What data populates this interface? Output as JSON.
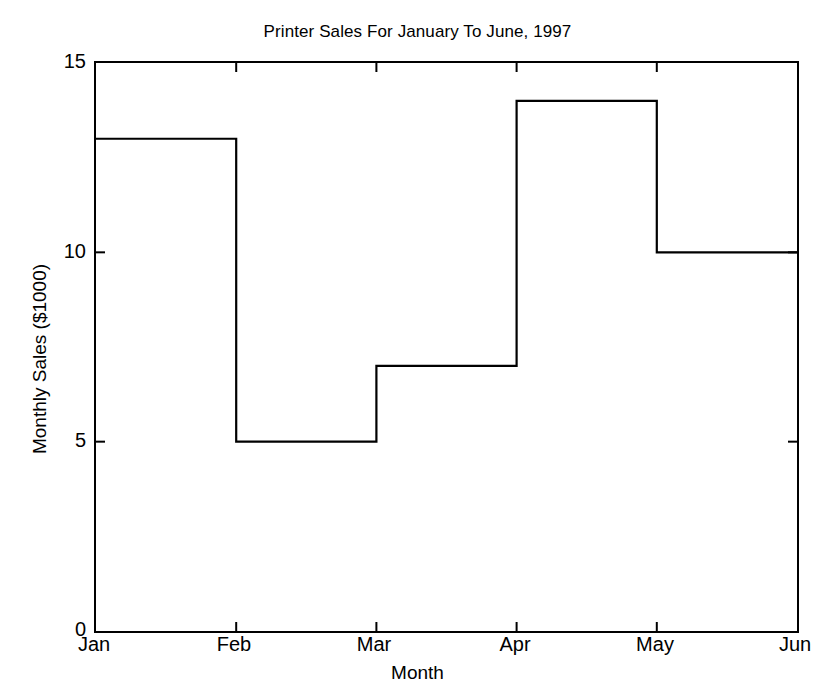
{
  "chart_data": {
    "type": "line",
    "plot_style": "stairstep",
    "title": "Printer Sales For January To June, 1997",
    "xlabel": "Month",
    "ylabel": "Monthly Sales ($1000)",
    "categories": [
      "Jan",
      "Feb",
      "Mar",
      "Apr",
      "May",
      "Jun"
    ],
    "values": [
      13,
      5,
      7,
      14,
      10,
      10
    ],
    "xtick_labels": [
      "Jan",
      "Feb",
      "Mar",
      "Apr",
      "May",
      "Jun"
    ],
    "ytick_labels": [
      "0",
      "5",
      "10",
      "15"
    ],
    "ytick_values": [
      0,
      5,
      10,
      15
    ],
    "ylim": [
      0,
      15
    ],
    "xlim": [
      0,
      5
    ],
    "grid": false,
    "legend": null,
    "line_color": "#000000",
    "background_color": "#ffffff",
    "series": [
      {
        "name": "Monthly Sales",
        "values": [
          13,
          5,
          7,
          14,
          10,
          10
        ]
      }
    ]
  },
  "axes": {
    "y_ticks": [
      {
        "label": "15",
        "value": 15
      },
      {
        "label": "10",
        "value": 10
      },
      {
        "label": "5",
        "value": 5
      },
      {
        "label": "0",
        "value": 0
      }
    ],
    "x_ticks": [
      {
        "label": "Jan",
        "index": 0
      },
      {
        "label": "Feb",
        "index": 1
      },
      {
        "label": "Mar",
        "index": 2
      },
      {
        "label": "Apr",
        "index": 3
      },
      {
        "label": "May",
        "index": 4
      },
      {
        "label": "Jun",
        "index": 5
      }
    ]
  }
}
